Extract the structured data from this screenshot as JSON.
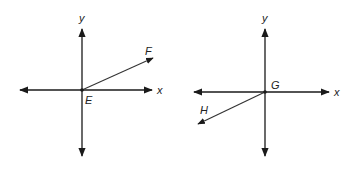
{
  "diagrams": [
    {
      "name": "left-plane",
      "axis_labels": {
        "x": "x",
        "y": "y"
      },
      "origin_label": "E",
      "ray_label": "F",
      "ray_direction": "first-quadrant"
    },
    {
      "name": "right-plane",
      "axis_labels": {
        "x": "x",
        "y": "y"
      },
      "origin_label": "G",
      "ray_label": "H",
      "ray_direction": "third-quadrant"
    }
  ],
  "colors": {
    "line": "#1a1a1a",
    "background": "#ffffff"
  }
}
